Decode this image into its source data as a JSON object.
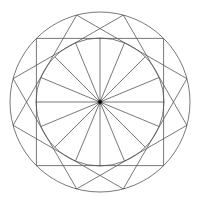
{
  "figure": {
    "center": [
      100,
      102
    ],
    "outer_radius": 90,
    "inner_radius": 64,
    "square_rotations_deg": [
      45,
      15,
      75
    ],
    "spoke_count": 16,
    "line_color": "#555555",
    "center_dot_color": "#000000"
  }
}
